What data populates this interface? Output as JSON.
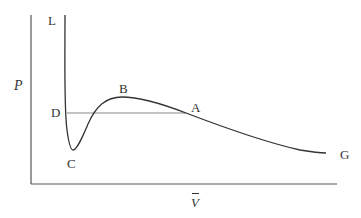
{
  "diagram": {
    "type": "pressure-volume isotherm (van der Waals loop)",
    "axes": {
      "y_label": "P",
      "x_label": "V"
    },
    "points": [
      {
        "id": "L",
        "label": "L"
      },
      {
        "id": "D",
        "label": "D"
      },
      {
        "id": "C",
        "label": "C"
      },
      {
        "id": "B",
        "label": "B"
      },
      {
        "id": "A",
        "label": "A"
      },
      {
        "id": "G",
        "label": "G"
      }
    ],
    "colors": {
      "axis": "#555555",
      "curve": "#333333",
      "tie_line": "#888888"
    }
  }
}
